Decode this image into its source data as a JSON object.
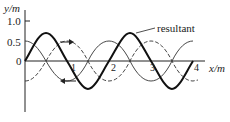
{
  "diagram": {
    "y_axis_label": "y/m",
    "x_axis_label": "x/m",
    "y_ticks": [
      "1.0",
      "0.5",
      "0"
    ],
    "x_ticks": [
      "1",
      "2",
      "3",
      "4"
    ],
    "annotation": "resultant",
    "curves": [
      {
        "name": "resultant",
        "style": "thick solid",
        "amplitude": 0.71
      },
      {
        "name": "wave moving right",
        "style": "dashed",
        "amplitude": 0.5,
        "direction": "right"
      },
      {
        "name": "wave moving left",
        "style": "thin solid",
        "amplitude": 0.5,
        "direction": "left"
      }
    ],
    "colors": {
      "ink": "#222222",
      "background": "#ffffff"
    }
  }
}
